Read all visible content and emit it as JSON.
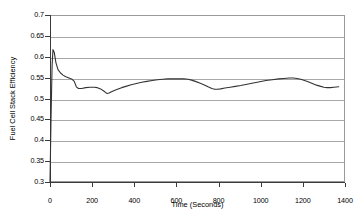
{
  "chart_data": {
    "type": "line",
    "title": "",
    "xlabel": "Time (Seconds)",
    "ylabel": "Fuel Cell Stack Efficiency",
    "xlim": [
      0,
      1400
    ],
    "ylim": [
      0.3,
      0.7
    ],
    "xticks": [
      0,
      200,
      400,
      600,
      800,
      1000,
      1200,
      1400
    ],
    "xtick_labels": [
      "0",
      "200",
      "400",
      "600",
      "800",
      "1000",
      "1200",
      "1400"
    ],
    "yticks": [
      0.3,
      0.35,
      0.4,
      0.45,
      0.5,
      0.55,
      0.6,
      0.65,
      0.7
    ],
    "ytick_labels": [
      "0.3",
      "0.35",
      "0.4",
      "0.45",
      "0.5",
      "0.55",
      "0.6",
      "0.65",
      "0.7"
    ],
    "grid": "horizontal",
    "legend": "none",
    "series": [
      {
        "name": "Fuel Cell Stack Efficiency",
        "color": "#333333",
        "x": [
          0,
          5,
          10,
          14,
          20,
          28,
          38,
          50,
          62,
          75,
          90,
          105,
          115,
          125,
          135,
          150,
          170,
          190,
          210,
          225,
          240,
          255,
          265,
          272,
          280,
          292,
          305,
          320,
          340,
          360,
          385,
          410,
          435,
          460,
          485,
          510,
          535,
          560,
          585,
          610,
          635,
          655,
          672,
          690,
          710,
          730,
          750,
          768,
          782,
          795,
          810,
          830,
          855,
          880,
          905,
          935,
          965,
          995,
          1025,
          1055,
          1085,
          1110,
          1135,
          1155,
          1172,
          1190,
          1208,
          1225,
          1245,
          1265,
          1285,
          1300,
          1315,
          1330,
          1348,
          1370
        ],
        "y": [
          0.3,
          0.455,
          0.58,
          0.617,
          0.611,
          0.586,
          0.569,
          0.561,
          0.556,
          0.552,
          0.549,
          0.546,
          0.541,
          0.528,
          0.524,
          0.524,
          0.526,
          0.527,
          0.527,
          0.526,
          0.523,
          0.518,
          0.514,
          0.512,
          0.513,
          0.516,
          0.519,
          0.522,
          0.526,
          0.529,
          0.533,
          0.536,
          0.539,
          0.541,
          0.543,
          0.545,
          0.546,
          0.547,
          0.547,
          0.547,
          0.547,
          0.546,
          0.544,
          0.541,
          0.537,
          0.533,
          0.528,
          0.524,
          0.522,
          0.522,
          0.523,
          0.525,
          0.527,
          0.529,
          0.531,
          0.534,
          0.537,
          0.54,
          0.543,
          0.545,
          0.547,
          0.548,
          0.549,
          0.549,
          0.548,
          0.546,
          0.543,
          0.54,
          0.536,
          0.532,
          0.529,
          0.527,
          0.526,
          0.526,
          0.527,
          0.528
        ]
      }
    ]
  }
}
